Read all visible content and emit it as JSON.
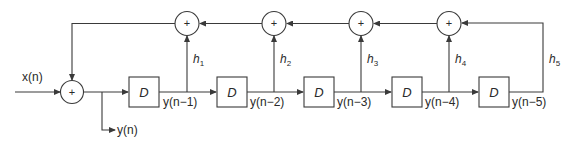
{
  "diagram": {
    "type": "block-diagram",
    "colors": {
      "line": "#3a3a3a",
      "background": "#ffffff",
      "text": "#2a2a2a"
    },
    "input": {
      "label": "x(n)"
    },
    "output": {
      "label": "y(n)"
    },
    "input_adder": {
      "symbol": "+"
    },
    "delays": [
      {
        "label": "D",
        "output": "y(n−1)"
      },
      {
        "label": "D",
        "output": "y(n−2)"
      },
      {
        "label": "D",
        "output": "y(n−3)"
      },
      {
        "label": "D",
        "output": "y(n−4)"
      },
      {
        "label": "D",
        "output": "y(n−5)"
      }
    ],
    "coefficients": [
      {
        "label": "h",
        "sub": "1"
      },
      {
        "label": "h",
        "sub": "2"
      },
      {
        "label": "h",
        "sub": "3"
      },
      {
        "label": "h",
        "sub": "4"
      },
      {
        "label": "h",
        "sub": "5"
      }
    ],
    "feedback_adders": [
      {
        "symbol": "+"
      },
      {
        "symbol": "+"
      },
      {
        "symbol": "+"
      },
      {
        "symbol": "+"
      }
    ]
  }
}
